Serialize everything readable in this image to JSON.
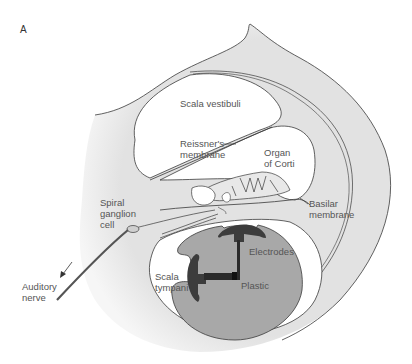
{
  "figure": {
    "panel_label": "A",
    "labels": {
      "scala_vestibuli": "Scala vestibuli",
      "reissners_1": "Reissner's",
      "reissners_2": "membrane",
      "organ_1": "Organ",
      "organ_2": "of Corti",
      "basilar_1": "Basilar",
      "basilar_2": "membrane",
      "spiral_1": "Spiral",
      "spiral_2": "ganglion",
      "spiral_3": "cell",
      "electrodes": "Electrodes",
      "scala_tympani_1": "Scala",
      "scala_tympani_2": "tympani",
      "plastic": "Plastic",
      "auditory_1": "Auditory",
      "auditory_2": "nerve"
    },
    "colors": {
      "bone": "#e4e4e4",
      "outline": "#3a3a3a",
      "implant_body": "#a8a8a8",
      "electrode": "#3c3c3c",
      "chamber": "#ffffff",
      "nerve": "#555555"
    }
  }
}
